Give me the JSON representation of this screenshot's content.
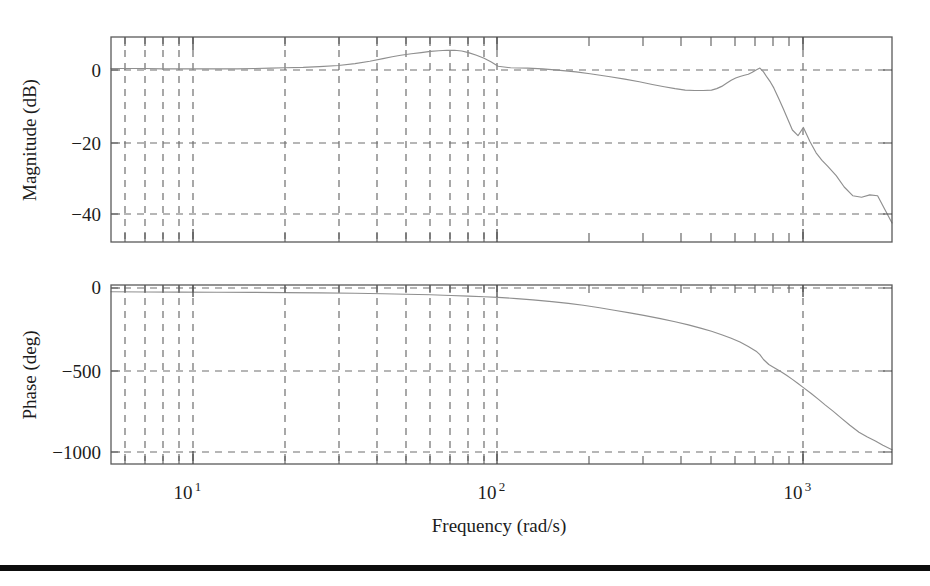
{
  "figure": {
    "title": "",
    "background": "#ffffff",
    "curve_color": "#8f8f8f",
    "grid_color": "#6e6e6e",
    "frame_color": "#5a5a5a",
    "rule_color": "#0d0d0d"
  },
  "xaxis": {
    "label": "Frequency (rad/s)",
    "scale": "log",
    "range": [
      5.4,
      1950
    ],
    "tick_values": [
      10,
      100,
      1000
    ],
    "tick_labels": [
      "10",
      "10",
      "10"
    ],
    "tick_exponents": [
      "1",
      "2",
      "3"
    ],
    "minor_ticks": [
      6,
      7,
      8,
      9,
      20,
      30,
      40,
      50,
      60,
      70,
      80,
      90,
      200,
      300,
      400,
      500,
      600,
      700,
      800,
      900
    ]
  },
  "magnitude_panel": {
    "ylabel": "Magnitude (dB)",
    "ylim": [
      -46,
      8
    ],
    "ytick_values": [
      0,
      -20,
      -40
    ],
    "ytick_labels": [
      "0",
      "−20",
      "−40"
    ],
    "grid": "dashed"
  },
  "phase_panel": {
    "ylabel": "Phase (deg)",
    "ylim": [
      -1090,
      40
    ],
    "ytick_values": [
      0,
      -500,
      -1000
    ],
    "ytick_labels": [
      "0",
      "−500",
      "−1000"
    ],
    "grid": "dashed"
  },
  "chart_data": {
    "type": "line",
    "title": "",
    "xlabel": "Frequency (rad/s)",
    "ylabel": "Magnitude (dB)",
    "xscale": "log",
    "xlim": [
      5.4,
      1950
    ],
    "grid": true,
    "legend": "none",
    "series": [
      {
        "name": "Magnitude",
        "panel": "magnitude",
        "ylabel": "Magnitude (dB)",
        "ylim": [
          -46,
          8
        ],
        "x": [
          5.4,
          6.0,
          7.0,
          8.0,
          9.0,
          10.0,
          12.0,
          14.0,
          16.0,
          18.0,
          20.0,
          23.0,
          26.0,
          30.0,
          34.0,
          38.0,
          42.0,
          45.0,
          48.0,
          52.0,
          56.0,
          60.0,
          64.0,
          68.0,
          72.0,
          76.0,
          80.0,
          85.0,
          90.0,
          95.0,
          100.0,
          110.0,
          125.0,
          140.0,
          160.0,
          180.0,
          200.0,
          230.0,
          260.0,
          290.0,
          320.0,
          350.0,
          380.0,
          410.0,
          440.0,
          470.0,
          500.0,
          520.0,
          540.0,
          560.0,
          580.0,
          600.0,
          620.0,
          640.0,
          660.0,
          680.0,
          700.0,
          720.0,
          740.0,
          760.0,
          780.0,
          800.0,
          830.0,
          860.0,
          890.0,
          920.0,
          960.0,
          1000.0,
          1050.0,
          1100.0,
          1150.0,
          1200.0,
          1280.0,
          1360.0,
          1450.0,
          1550.0,
          1650.0,
          1750.0,
          1850.0,
          1950.0
        ],
        "y": [
          -0.3,
          -0.3,
          -0.3,
          -0.4,
          -0.4,
          -0.4,
          -0.4,
          -0.4,
          -0.3,
          -0.2,
          -0.1,
          0.0,
          0.2,
          0.5,
          1.0,
          1.6,
          2.3,
          2.8,
          3.2,
          3.6,
          3.9,
          4.2,
          4.4,
          4.5,
          4.5,
          4.3,
          3.9,
          3.2,
          2.4,
          1.4,
          0.3,
          -0.1,
          -0.2,
          -0.4,
          -0.8,
          -1.2,
          -1.7,
          -2.4,
          -3.1,
          -3.8,
          -4.5,
          -5.1,
          -5.6,
          -6.0,
          -6.1,
          -6.1,
          -6.0,
          -5.6,
          -5.0,
          -4.2,
          -3.4,
          -2.8,
          -2.4,
          -2.1,
          -1.8,
          -1.3,
          -0.7,
          -0.2,
          -1.2,
          -2.6,
          -3.9,
          -5.4,
          -8.2,
          -11.0,
          -13.8,
          -16.5,
          -18.0,
          -15.8,
          -19.5,
          -22.5,
          -24.5,
          -26.0,
          -28.5,
          -31.5,
          -33.8,
          -34.2,
          -33.6,
          -33.8,
          -37.5,
          -41.0
        ],
        "notes": "Flat near 0 dB below 20 rad/s, gentle resonant rise peaking about +4.5 dB near 70 rad/s, descent to about -6 dB near 440 rad/s, secondary peak reaching about 0 dB at 700-720 rad/s, then a steep roll-off with a notch near 1000 rad/s and a shelf near -34 dB at 1400-1750 rad/s, ending near -41 dB."
      },
      {
        "name": "Phase",
        "panel": "phase",
        "ylabel": "Phase (deg)",
        "ylim": [
          -1090,
          40
        ],
        "x": [
          5.4,
          7.0,
          9.0,
          12.0,
          16.0,
          20.0,
          26.0,
          34.0,
          42.0,
          50.0,
          60.0,
          70.0,
          80.0,
          90.0,
          100.0,
          115.0,
          130.0,
          150.0,
          170.0,
          190.0,
          215.0,
          240.0,
          270.0,
          300.0,
          340.0,
          380.0,
          420.0,
          460.0,
          500.0,
          540.0,
          580.0,
          620.0,
          660.0,
          700.0,
          720.0,
          740.0,
          770.0,
          800.0,
          840.0,
          880.0,
          920.0,
          960.0,
          1000.0,
          1060.0,
          1120.0,
          1180.0,
          1250.0,
          1330.0,
          1420.0,
          1520.0,
          1620.0,
          1720.0,
          1820.0,
          1950.0
        ],
        "y": [
          -3,
          -4,
          -5,
          -6,
          -7,
          -8,
          -10,
          -12,
          -15,
          -18,
          -22,
          -26,
          -30,
          -34,
          -38,
          -46,
          -54,
          -65,
          -76,
          -88,
          -104,
          -120,
          -136,
          -152,
          -172,
          -192,
          -212,
          -232,
          -252,
          -274,
          -296,
          -320,
          -348,
          -378,
          -400,
          -430,
          -462,
          -480,
          -505,
          -530,
          -556,
          -582,
          -608,
          -645,
          -682,
          -718,
          -756,
          -800,
          -846,
          -890,
          -920,
          -945,
          -972,
          -1000
        ],
        "notes": "Starts near 0 deg, falls slowly through the low decade, passes about -250 deg near 500 rad/s, steepens sharply near 700-800 rad/s, crosses -500 deg near 830 rad/s and reaches about -1000 deg at the right edge."
      }
    ]
  }
}
